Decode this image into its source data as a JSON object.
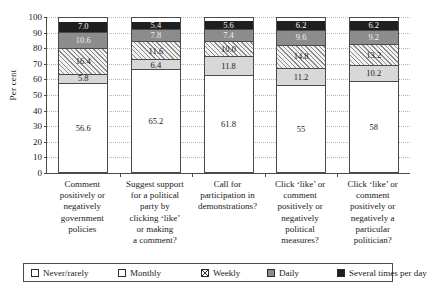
{
  "chart_data": {
    "type": "bar",
    "subtype": "stacked-percentage",
    "title": "",
    "xlabel": "",
    "ylabel": "Per cent",
    "ylim": [
      0,
      100
    ],
    "yticks": [
      0,
      10,
      20,
      30,
      40,
      50,
      60,
      70,
      80,
      90,
      100
    ],
    "grid": "horizontal-dotted",
    "legend_position": "bottom",
    "categories": [
      "Comment positively or negatively government policies",
      "Suggest support for a political party by clicking ‘like’ or making a comment?",
      "Call for participation in demonstrations?",
      "Click ‘like’ or comment positively or negatively political measures?",
      "Click ‘like’ or comment positively or negatively a particular politician?"
    ],
    "category_lines": [
      [
        "Comment",
        "positively or",
        "negatively",
        "government",
        "policies"
      ],
      [
        "Suggest support",
        "for a political",
        "party by",
        "clicking ‘like’",
        "or making",
        "a comment?"
      ],
      [
        "Call for",
        "participation in",
        "demonstrations?"
      ],
      [
        "Click ‘like’ or",
        "comment",
        "positively or",
        "negatively",
        "political",
        "measures?"
      ],
      [
        "Click ‘like’ or",
        "comment",
        "positively or",
        "negatively a",
        "particular",
        "politician?"
      ]
    ],
    "series": [
      {
        "name": "Never/rarely",
        "key": "never",
        "color": "#ffffff",
        "pattern": "solid",
        "values": [
          56.6,
          65.2,
          61.8,
          55.0,
          58.0
        ],
        "labels": [
          "56.6",
          "65.2",
          "61.8",
          "55",
          "58"
        ]
      },
      {
        "name": "Monthly",
        "key": "month",
        "color": "#d8d8d8",
        "pattern": "solid",
        "values": [
          5.8,
          6.4,
          11.8,
          11.2,
          10.2
        ],
        "labels": [
          "5.8",
          "6.4",
          "11.8",
          "11.2",
          "10.2"
        ]
      },
      {
        "name": "Weekly",
        "key": "week",
        "color": "#f2f2f2",
        "pattern": "diagonal-hatch",
        "values": [
          16.4,
          11.6,
          10.0,
          14.8,
          13.2
        ],
        "labels": [
          "16.4",
          "11.6",
          "10.0",
          "14.8",
          "13.2"
        ]
      },
      {
        "name": "Daily",
        "key": "daily",
        "color": "#8c8c8c",
        "pattern": "solid",
        "values": [
          10.6,
          7.8,
          7.4,
          9.6,
          9.2
        ],
        "labels": [
          "10.6",
          "7.8",
          "7.4",
          "9.6",
          "9.2"
        ]
      },
      {
        "name": "Several times per day",
        "key": "several",
        "color": "#1f1f1f",
        "pattern": "solid",
        "values": [
          7.0,
          5.4,
          5.6,
          6.2,
          6.2
        ],
        "labels": [
          "7.0",
          "5.4",
          "5.6",
          "6.2",
          "6.2"
        ]
      }
    ]
  }
}
